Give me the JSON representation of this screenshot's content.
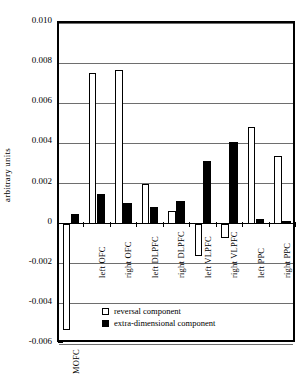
{
  "chart_data": {
    "type": "bar",
    "title": "",
    "xlabel": "",
    "ylabel": "arbitrary units",
    "ylim": [
      -0.006,
      0.01
    ],
    "ytick_labels": [
      "0.010",
      "0.008",
      "0.006",
      "0.004",
      "0.002",
      "0",
      "-0.002",
      "-0.004",
      "-0.006"
    ],
    "ytick_values": [
      0.01,
      0.008,
      0.006,
      0.004,
      0.002,
      0,
      -0.002,
      -0.004,
      -0.006
    ],
    "grid": true,
    "legend_position": "inside-bottom-center",
    "categories": [
      "MOFC",
      "left OFC",
      "right OFC",
      "left DLPFC",
      "right DLPFC",
      "left VLPFC",
      "right VLPFC",
      "left PPC",
      "right PPC"
    ],
    "series": [
      {
        "name": "reversal component",
        "style": "open",
        "values": [
          -0.0053,
          0.0075,
          0.00768,
          0.00196,
          0.00065,
          -0.0016,
          -0.0007,
          0.00483,
          0.00337
        ]
      },
      {
        "name": "extra-dimensional component",
        "style": "filled",
        "values": [
          0.00048,
          0.00147,
          0.00104,
          0.00085,
          0.00113,
          0.00311,
          0.00409,
          0.00022,
          0.00014
        ]
      }
    ]
  },
  "legend": {
    "items": [
      {
        "label": "reversal component",
        "style": "open"
      },
      {
        "label": "extra-dimensional component",
        "style": "filled"
      }
    ]
  }
}
